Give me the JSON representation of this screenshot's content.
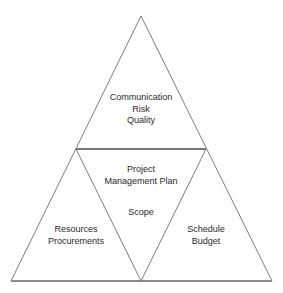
{
  "diagram": {
    "type": "nested-triangle",
    "background_color": "#ffffff",
    "line_color": "#6e6e6e",
    "base_line_color": "#8c8c8c",
    "text_color": "#2b2b2b",
    "geometry": {
      "apex": [
        141,
        16
      ],
      "bottom_left": [
        11,
        281
      ],
      "bottom_right": [
        272,
        281
      ],
      "mid_left": [
        76,
        149
      ],
      "mid_right": [
        206,
        149
      ],
      "mid_bottom": [
        141,
        281
      ]
    },
    "regions": {
      "top": {
        "name": "top-triangle",
        "lines": [
          "Communication",
          "Risk",
          "Quality"
        ]
      },
      "center_upper": {
        "name": "center-triangle-upper",
        "lines": [
          "Project",
          "Management Plan"
        ]
      },
      "center_lower": {
        "name": "center-triangle-lower",
        "lines": [
          "Scope"
        ]
      },
      "left": {
        "name": "left-triangle",
        "lines": [
          "Resources",
          "Procurements"
        ]
      },
      "right": {
        "name": "right-triangle",
        "lines": [
          "Schedule",
          "Budget"
        ]
      }
    }
  }
}
